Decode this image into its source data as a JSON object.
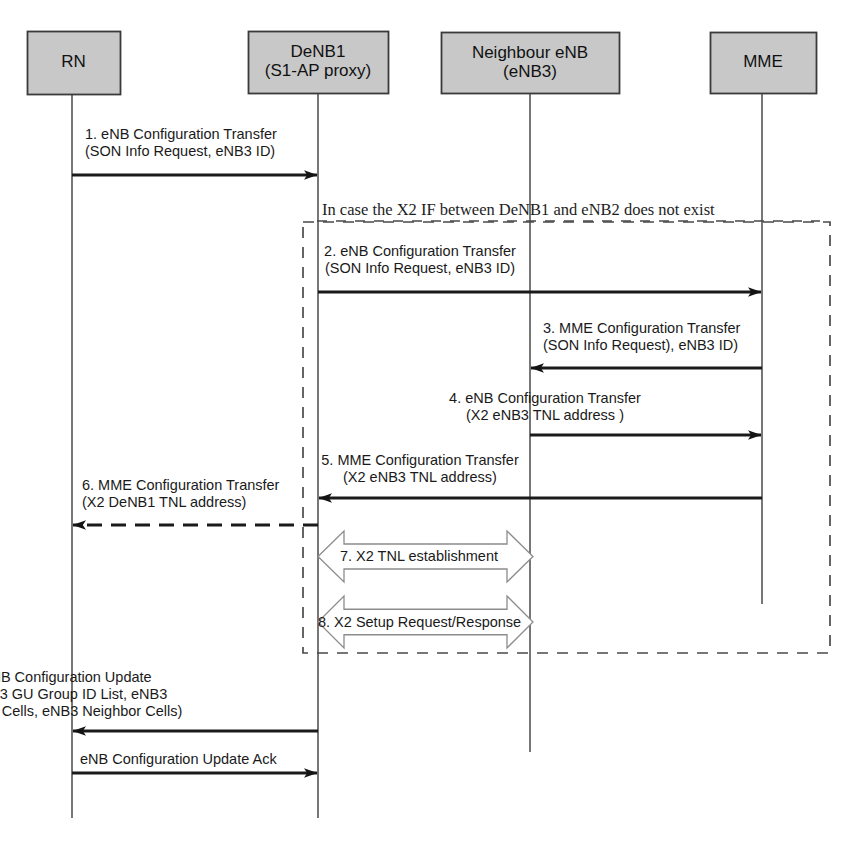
{
  "diagram": {
    "kind": "sequence-diagram",
    "title_visible": false,
    "canvas": {
      "width": 844,
      "height": 854
    },
    "colors": {
      "actor_fill": "#c8c8c8",
      "actor_border": "#3a3a3a",
      "line": "#1a1a1a",
      "lifeline": "#555555",
      "frame_dash": "#4a4a4a",
      "hollow_arrow_stroke": "#8c8c8c",
      "hollow_arrow_fill": "#ffffff",
      "background": "#ffffff"
    },
    "actors": [
      {
        "id": "rn",
        "lines": [
          "RN"
        ],
        "box": {
          "x": 27,
          "y": 31,
          "w": 93,
          "h": 63
        },
        "lifeline_x": 72,
        "lifeline_bottom": 818
      },
      {
        "id": "denb1",
        "lines": [
          "DeNB1",
          "(S1-AP proxy)"
        ],
        "box": {
          "x": 248,
          "y": 31,
          "w": 140,
          "h": 62
        },
        "lifeline_x": 318,
        "lifeline_bottom": 818
      },
      {
        "id": "enb3",
        "lines": [
          "Neighbour eNB",
          "(eNB3)"
        ],
        "box": {
          "x": 441,
          "y": 32,
          "w": 178,
          "h": 61
        },
        "lifeline_x": 530,
        "lifeline_bottom": 752
      },
      {
        "id": "mme",
        "lines": [
          "MME"
        ],
        "box": {
          "x": 710,
          "y": 32,
          "w": 106,
          "h": 61
        },
        "lifeline_x": 762,
        "lifeline_bottom": 604
      }
    ],
    "frame": {
      "label": "In case the X2 IF between DeNB1 and eNB2 does not exist",
      "label_x": 322,
      "label_y": 200,
      "rect": {
        "x": 303,
        "y": 222,
        "w": 527,
        "h": 431
      },
      "style": "dashed"
    },
    "messages": [
      {
        "id": "m1",
        "number": "1.",
        "lines": [
          "1. eNB Configuration Transfer",
          "(SON Info Request, eNB3 ID)"
        ],
        "from": "rn",
        "to": "denb1",
        "arrow_y": 175,
        "label_x": 85,
        "label_y": 126,
        "label_align": "left",
        "style": "solid",
        "arrowhead": "filled"
      },
      {
        "id": "m2",
        "number": "2.",
        "lines": [
          "2. eNB Configuration Transfer",
          "(SON Info Request, eNB3 ID)"
        ],
        "from": "denb1",
        "to": "mme",
        "arrow_y": 292,
        "label_x": 420,
        "label_y": 243,
        "label_align": "center",
        "style": "solid",
        "arrowhead": "filled"
      },
      {
        "id": "m3",
        "number": "3.",
        "lines": [
          "3. MME Configuration Transfer",
          "(SON Info Request), eNB3 ID)"
        ],
        "from": "mme",
        "to": "enb3",
        "arrow_y": 368,
        "label_x": 543,
        "label_y": 320,
        "label_align": "left",
        "style": "solid",
        "arrowhead": "filled"
      },
      {
        "id": "m4",
        "number": "4.",
        "lines": [
          "4. eNB Configuration Transfer",
          "(X2 eNB3 TNL  address )"
        ],
        "from": "enb3",
        "to": "mme",
        "arrow_y": 435,
        "label_x": 545,
        "label_y": 390,
        "label_align": "center",
        "style": "solid",
        "arrowhead": "filled"
      },
      {
        "id": "m5",
        "number": "5.",
        "lines": [
          "5. MME Configuration Transfer",
          "(X2 eNB3 TNL address)"
        ],
        "from": "mme",
        "to": "denb1",
        "arrow_y": 498,
        "label_x": 420,
        "label_y": 452,
        "label_align": "center",
        "style": "solid",
        "arrowhead": "filled"
      },
      {
        "id": "m6",
        "number": "6.",
        "lines": [
          "6. MME Configuration Transfer",
          "(X2 DeNB1 TNL address)"
        ],
        "from": "denb1",
        "to": "rn",
        "arrow_y": 525,
        "label_x": 82,
        "label_y": 477,
        "label_align": "left",
        "style": "dashed",
        "arrowhead": "filled"
      },
      {
        "id": "m9",
        "number": "",
        "lines": [
          "eNB Configuration Update",
          "(eNB3 GU Group ID List, eNB3",
          "Served Cells, eNB3 Neighbor Cells)"
        ],
        "from": "denb1",
        "to": "rn",
        "arrow_y": 731,
        "label_x": 67,
        "label_y": 669,
        "label_align": "center",
        "style": "solid",
        "arrowhead": "filled"
      },
      {
        "id": "m10",
        "number": "",
        "lines": [
          "eNB Configuration Update Ack"
        ],
        "from": "rn",
        "to": "denb1",
        "arrow_y": 773,
        "label_x": 80,
        "label_y": 751,
        "label_align": "left",
        "style": "solid",
        "arrowhead": "filled"
      }
    ],
    "bidirectional_blocks": [
      {
        "id": "b7",
        "number": "7.",
        "label": "7. X2 TNL establishment",
        "from": "denb1",
        "to": "enb3",
        "rect": {
          "x": 318,
          "y": 531,
          "w": 215,
          "h": 51
        },
        "label_x": 340,
        "label_y": 548
      },
      {
        "id": "b8",
        "number": "8.",
        "label": "8. X2 Setup Request/Response",
        "from": "denb1",
        "to": "enb3",
        "rect": {
          "x": 318,
          "y": 596,
          "w": 215,
          "h": 52
        },
        "label_x": 318,
        "label_y": 614
      }
    ]
  }
}
